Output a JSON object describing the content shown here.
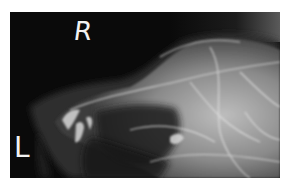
{
  "image": {
    "kind": "radiograph",
    "subject": "lateral skull x-ray of a canine muzzle",
    "markers": {
      "right": "R",
      "left": "L"
    },
    "colors": {
      "background": "#0a0a0a",
      "bone_highlight": "#e6e6e6",
      "soft_tissue": "#3a3a3a",
      "border": "#ffffff"
    }
  }
}
